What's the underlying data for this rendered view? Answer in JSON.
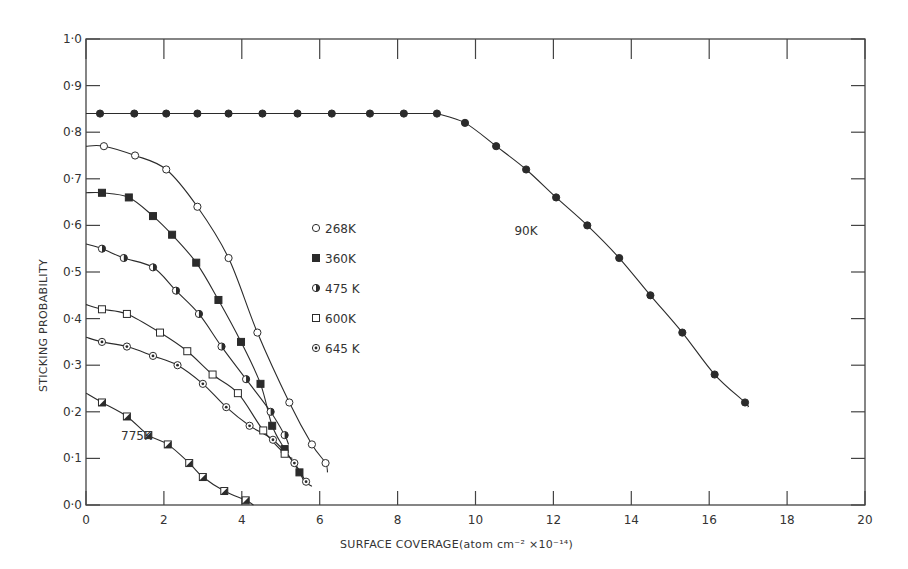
{
  "chart_data": {
    "type": "scatter",
    "title": "",
    "xlabel": "SURFACE COVERAGE(atom cm⁻² ×10⁻¹⁴)",
    "ylabel": "STICKING PROBABILITY",
    "xlim": [
      0,
      20
    ],
    "ylim": [
      0,
      1.0
    ],
    "xticks": [
      0,
      2,
      4,
      6,
      8,
      10,
      12,
      14,
      16,
      18,
      20
    ],
    "xtick_labels": [
      "0",
      "2",
      "4",
      "6",
      "8",
      "10",
      "12",
      "14",
      "16",
      "18",
      "20"
    ],
    "yticks": [
      0,
      0.1,
      0.2,
      0.3,
      0.4,
      0.5,
      0.6,
      0.7,
      0.8,
      0.9,
      1.0
    ],
    "ytick_labels": [
      "0·0",
      "0·1",
      "0·2",
      "0·3",
      "0·4",
      "0·5",
      "0·6",
      "0·7",
      "0·8",
      "0·9",
      "1·0"
    ],
    "grid": false,
    "legend_position": "inside, center-left (x≈6.5, y≈0.37–0.64)",
    "legend": [
      {
        "label": "268K",
        "marker": "open-circle"
      },
      {
        "label": "360K",
        "marker": "filled-square"
      },
      {
        "label": "475 K",
        "marker": "half-filled-circle"
      },
      {
        "label": "600K",
        "marker": "open-square"
      },
      {
        "label": "645 K",
        "marker": "dotted-circle"
      }
    ],
    "annotations": [
      {
        "text": "90K",
        "x": 11.0,
        "y": 0.58
      },
      {
        "text": "775K",
        "x": 0.9,
        "y": 0.14
      }
    ],
    "series": [
      {
        "name": "90K",
        "marker": "filled-circle",
        "x": [
          0.36,
          1.24,
          2.06,
          2.86,
          3.66,
          4.53,
          5.43,
          6.31,
          7.29,
          8.16,
          9.01,
          9.73,
          10.53,
          11.3,
          12.07,
          12.87,
          13.69,
          14.49,
          15.31,
          16.14,
          16.92
        ],
        "y": [
          0.84,
          0.84,
          0.84,
          0.84,
          0.84,
          0.84,
          0.84,
          0.84,
          0.84,
          0.84,
          0.84,
          0.82,
          0.77,
          0.72,
          0.66,
          0.6,
          0.53,
          0.45,
          0.37,
          0.28,
          0.22
        ],
        "curve_start_y": 0.84,
        "curve_end": [
          17.0,
          0.21
        ]
      },
      {
        "name": "268K",
        "marker": "open-circle",
        "x": [
          0.46,
          1.26,
          2.06,
          2.86,
          3.66,
          4.4,
          5.22,
          5.8,
          6.15
        ],
        "y": [
          0.77,
          0.75,
          0.72,
          0.64,
          0.53,
          0.37,
          0.22,
          0.13,
          0.09
        ],
        "curve_start_y": 0.77,
        "curve_end": [
          6.2,
          0.07
        ]
      },
      {
        "name": "360K",
        "marker": "filled-square",
        "x": [
          0.41,
          1.1,
          1.72,
          2.21,
          2.83,
          3.4,
          3.98,
          4.48,
          4.78,
          5.1,
          5.48
        ],
        "y": [
          0.67,
          0.66,
          0.62,
          0.58,
          0.52,
          0.44,
          0.35,
          0.26,
          0.17,
          0.12,
          0.07
        ],
        "curve_start_y": 0.67,
        "curve_end": [
          5.6,
          0.05
        ]
      },
      {
        "name": "475 K",
        "marker": "half-filled-circle",
        "x": [
          0.41,
          0.97,
          1.72,
          2.31,
          2.9,
          3.48,
          4.11,
          4.74,
          5.1
        ],
        "y": [
          0.55,
          0.53,
          0.51,
          0.46,
          0.41,
          0.34,
          0.27,
          0.2,
          0.15
        ],
        "curve_start_y": 0.56,
        "curve_end": [
          5.2,
          0.13
        ]
      },
      {
        "name": "600K",
        "marker": "open-square",
        "x": [
          0.41,
          1.05,
          1.9,
          2.6,
          3.25,
          3.9,
          4.55,
          5.1
        ],
        "y": [
          0.42,
          0.41,
          0.37,
          0.33,
          0.28,
          0.24,
          0.16,
          0.11
        ],
        "curve_start_y": 0.43,
        "curve_end": [
          5.3,
          0.1
        ]
      },
      {
        "name": "645 K",
        "marker": "dotted-circle",
        "x": [
          0.41,
          1.05,
          1.72,
          2.35,
          3.0,
          3.6,
          4.2,
          4.8,
          5.35,
          5.65
        ],
        "y": [
          0.35,
          0.34,
          0.32,
          0.3,
          0.26,
          0.21,
          0.17,
          0.14,
          0.09,
          0.05
        ],
        "curve_start_y": 0.36,
        "curve_end": [
          5.8,
          0.04
        ]
      },
      {
        "name": "775K",
        "marker": "half-filled-square",
        "x": [
          0.41,
          1.05,
          1.6,
          2.1,
          2.65,
          3.0,
          3.55,
          4.1
        ],
        "y": [
          0.22,
          0.19,
          0.15,
          0.13,
          0.09,
          0.06,
          0.03,
          0.01
        ],
        "curve_start_y": 0.24,
        "curve_end": [
          4.3,
          0.0
        ]
      }
    ]
  },
  "colors": {
    "ink": "#2b2b2b",
    "axis": "#444444",
    "background": "#ffffff"
  }
}
